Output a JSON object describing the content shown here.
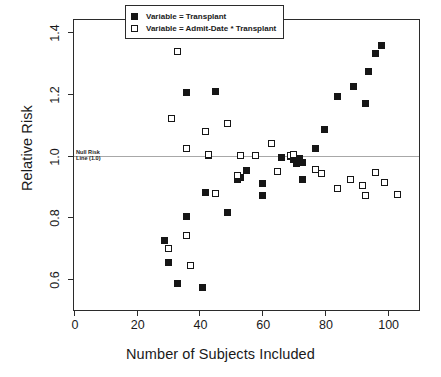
{
  "chart_data": {
    "type": "scatter",
    "title": "",
    "xlabel": "Number of Subjects Included",
    "ylabel": "Relative Risk",
    "xlim": [
      0,
      110
    ],
    "ylim": [
      0.5,
      1.44
    ],
    "xticks": [
      "0",
      "20",
      "40",
      "60",
      "80",
      "100"
    ],
    "xtick_values": [
      0,
      20,
      40,
      60,
      80,
      100
    ],
    "yticks": [
      "0.6",
      "0.8",
      "1.0",
      "1.2",
      "1.4"
    ],
    "ytick_values": [
      0.6,
      0.8,
      1.0,
      1.2,
      1.4
    ],
    "grid": false,
    "legend_position": "top-center",
    "annotations": [
      {
        "name": "null-risk-line",
        "line1": "Null Risk",
        "line2": "Line (1.0)",
        "y": 1.0,
        "color": "#a8a8a8"
      }
    ],
    "series": [
      {
        "name": "Variable = Transplant",
        "marker": "filled-square",
        "color": "#161616",
        "points": [
          [
            29,
            0.725
          ],
          [
            30,
            0.655
          ],
          [
            33,
            0.585
          ],
          [
            36,
            0.803
          ],
          [
            36,
            1.205
          ],
          [
            41,
            0.572
          ],
          [
            42,
            0.882
          ],
          [
            43,
            1.001
          ],
          [
            45,
            1.208
          ],
          [
            49,
            0.815
          ],
          [
            52,
            0.922
          ],
          [
            53,
            0.928
          ],
          [
            55,
            0.952
          ],
          [
            60,
            0.872
          ],
          [
            60,
            0.911
          ],
          [
            66,
            0.995
          ],
          [
            69,
            0.997
          ],
          [
            70,
            0.988
          ],
          [
            71,
            0.975
          ],
          [
            72,
            0.992
          ],
          [
            73,
            0.978
          ],
          [
            73,
            0.922
          ],
          [
            77,
            1.025
          ],
          [
            80,
            1.085
          ],
          [
            84,
            1.191
          ],
          [
            89,
            1.223
          ],
          [
            93,
            1.168
          ],
          [
            94,
            1.272
          ],
          [
            96,
            1.332
          ],
          [
            98,
            1.357
          ]
        ]
      },
      {
        "name": "Variable = Admit-Date * Transplant",
        "marker": "open-square",
        "color": "#161616",
        "points": [
          [
            30,
            0.7
          ],
          [
            31,
            1.122
          ],
          [
            33,
            1.338
          ],
          [
            36,
            1.022
          ],
          [
            36,
            0.742
          ],
          [
            37,
            0.643
          ],
          [
            42,
            1.078
          ],
          [
            43,
            1.003
          ],
          [
            45,
            0.877
          ],
          [
            49,
            1.105
          ],
          [
            52,
            0.935
          ],
          [
            53,
            1.001
          ],
          [
            58,
            1.0
          ],
          [
            63,
            1.04
          ],
          [
            65,
            0.948
          ],
          [
            69,
            1.0
          ],
          [
            70,
            1.003
          ],
          [
            77,
            0.957
          ],
          [
            79,
            0.941
          ],
          [
            84,
            0.894
          ],
          [
            88,
            0.923
          ],
          [
            92,
            0.902
          ],
          [
            93,
            0.872
          ],
          [
            96,
            0.947
          ],
          [
            99,
            0.913
          ],
          [
            103,
            0.873
          ]
        ]
      }
    ]
  },
  "legend": {
    "items": [
      {
        "label": "Variable = Transplant",
        "marker": "filled-square"
      },
      {
        "label": "Variable = Admit-Date * Transplant",
        "marker": "open-square"
      }
    ]
  }
}
